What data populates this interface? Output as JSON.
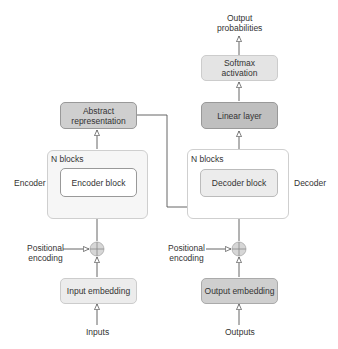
{
  "encoder": {
    "side_label": "Encoder",
    "container_label": "N blocks",
    "block_label": "Encoder block",
    "output_box": "Abstract representation",
    "output_box_lines": [
      "Abstract",
      "representation"
    ],
    "positional_encoding": "Positional encoding",
    "positional_encoding_lines": [
      "Positional",
      "encoding"
    ],
    "embedding_label": "Input embedding",
    "input_label": "Inputs"
  },
  "decoder": {
    "side_label": "Decoder",
    "container_label": "N blocks",
    "block_label": "Decoder block",
    "linear_label": "Linear layer",
    "softmax_lines": [
      "Softmax",
      "activation"
    ],
    "output_label_lines": [
      "Output",
      "probabilities"
    ],
    "positional_encoding_lines": [
      "Positional",
      "encoding"
    ],
    "embedding_label": "Output embedding",
    "input_label": "Outputs"
  },
  "colors": {
    "container_fill": "#f6f6f6",
    "light_box": "#ececec",
    "dark_box": "#cfcfcf",
    "line": "#555555"
  }
}
